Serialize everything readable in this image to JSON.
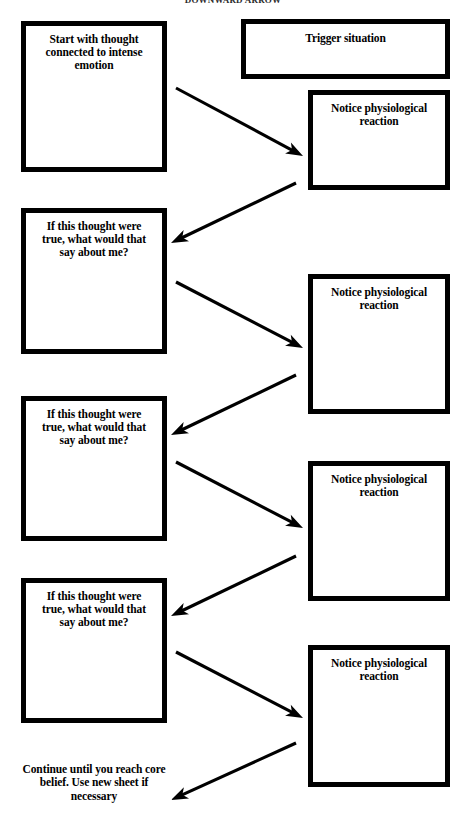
{
  "document": {
    "title_partial": "DOWNWARD ARROW",
    "type": "worksheet-flowchart",
    "background_color": "#ffffff",
    "ink_color": "#000000"
  },
  "nodes": [
    {
      "id": "start-thought",
      "name": "start-with-thought-box",
      "label": "Start with thought connected to intense emotion",
      "column": "left",
      "x": 21,
      "y": 21,
      "w": 146,
      "h": 151
    },
    {
      "id": "trigger-situation",
      "name": "trigger-situation-box",
      "label": "Trigger situation",
      "column": "right",
      "x": 241,
      "y": 19,
      "w": 209,
      "h": 60
    },
    {
      "id": "physio-1",
      "name": "notice-physiological-reaction-box-1",
      "label": "Notice physiological reaction",
      "column": "right",
      "x": 308,
      "y": 90,
      "w": 142,
      "h": 100
    },
    {
      "id": "question-1",
      "name": "if-this-thought-were-true-box-1",
      "label": "If this thought were true, what would that say about me?",
      "column": "left",
      "x": 21,
      "y": 208,
      "w": 146,
      "h": 146
    },
    {
      "id": "physio-2",
      "name": "notice-physiological-reaction-box-2",
      "label": "Notice physiological reaction",
      "column": "right",
      "x": 308,
      "y": 274,
      "w": 142,
      "h": 140
    },
    {
      "id": "question-2",
      "name": "if-this-thought-were-true-box-2",
      "label": "If this thought were true, what would that say about me?",
      "column": "left",
      "x": 21,
      "y": 396,
      "w": 146,
      "h": 145
    },
    {
      "id": "physio-3",
      "name": "notice-physiological-reaction-box-3",
      "label": "Notice physiological reaction",
      "column": "right",
      "x": 308,
      "y": 461,
      "w": 142,
      "h": 140
    },
    {
      "id": "question-3",
      "name": "if-this-thought-were-true-box-3",
      "label": "If this thought were true, what would that say about me?",
      "column": "left",
      "x": 21,
      "y": 578,
      "w": 146,
      "h": 145
    },
    {
      "id": "physio-4",
      "name": "notice-physiological-reaction-box-4",
      "label": "Notice physiological reaction",
      "column": "right",
      "x": 308,
      "y": 645,
      "w": 142,
      "h": 142
    }
  ],
  "free_text": [
    {
      "id": "closing-note",
      "name": "continue-until-core-belief-note",
      "label": "Continue until you reach core belief. Use new sheet if necessary",
      "x": 16,
      "y": 763,
      "w": 156
    }
  ],
  "arrows": [
    {
      "id": "a1",
      "name": "arrow-down-right-1",
      "direction": "down-right",
      "x1": 176,
      "y1": 88,
      "x2": 303,
      "y2": 156
    },
    {
      "id": "a2",
      "name": "arrow-down-left-1",
      "direction": "down-left",
      "x1": 296,
      "y1": 183,
      "x2": 171,
      "y2": 243
    },
    {
      "id": "a3",
      "name": "arrow-down-right-2",
      "direction": "down-right",
      "x1": 176,
      "y1": 282,
      "x2": 303,
      "y2": 348
    },
    {
      "id": "a4",
      "name": "arrow-down-left-2",
      "direction": "down-left",
      "x1": 296,
      "y1": 375,
      "x2": 171,
      "y2": 435
    },
    {
      "id": "a5",
      "name": "arrow-down-right-3",
      "direction": "down-right",
      "x1": 176,
      "y1": 462,
      "x2": 303,
      "y2": 528
    },
    {
      "id": "a6",
      "name": "arrow-down-left-3",
      "direction": "down-left",
      "x1": 296,
      "y1": 556,
      "x2": 171,
      "y2": 616
    },
    {
      "id": "a7",
      "name": "arrow-down-right-4",
      "direction": "down-right",
      "x1": 176,
      "y1": 652,
      "x2": 303,
      "y2": 718
    },
    {
      "id": "a8",
      "name": "arrow-down-left-4",
      "direction": "down-left",
      "x1": 296,
      "y1": 743,
      "x2": 171,
      "y2": 800
    }
  ]
}
